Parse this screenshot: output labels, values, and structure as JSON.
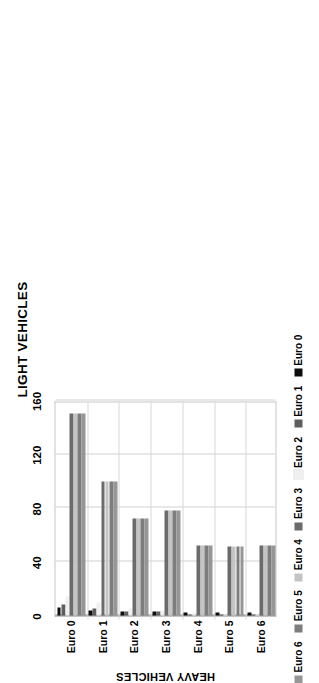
{
  "chart_data": {
    "type": "bar",
    "title": "LIGHT VEHICLES",
    "orientation": "horizontal",
    "xlabel": "",
    "ylabel": "HEAVY VEHICLES",
    "categories": [
      "Euro 0",
      "Euro 1",
      "Euro 2",
      "Euro 3",
      "Euro 4",
      "Euro 5",
      "Euro 6"
    ],
    "xlim": [
      0,
      160
    ],
    "xticks": [
      0,
      40,
      80,
      120,
      160
    ],
    "xtick_labels": [
      "0",
      "40",
      "80",
      "120",
      "160"
    ],
    "grid": true,
    "legend_position": "bottom",
    "legend_order_displayed": [
      "Euro 6",
      "Euro 5",
      "Euro 4",
      "Euro 3",
      "Euro 2",
      "Euro 1",
      "Euro 0"
    ],
    "series": [
      {
        "name": "Euro 0",
        "color": "#0d0d0d",
        "values": [
          6,
          4,
          3,
          3,
          2,
          2,
          2
        ]
      },
      {
        "name": "Euro 1",
        "color": "#5e5e5e",
        "values": [
          8,
          5,
          3,
          3,
          1,
          1,
          1
        ]
      },
      {
        "name": "Euro 2",
        "color": "#f0f0f0",
        "values": [
          14,
          10,
          5,
          4,
          2,
          1,
          1
        ]
      },
      {
        "name": "Euro 3",
        "color": "#6b6b6b",
        "values": [
          150,
          100,
          72,
          78,
          52,
          51,
          52
        ]
      },
      {
        "name": "Euro 4",
        "color": "#c4c4c4",
        "values": [
          150,
          100,
          72,
          78,
          52,
          51,
          52
        ]
      },
      {
        "name": "Euro 5",
        "color": "#7d7d7d",
        "values": [
          150,
          100,
          72,
          78,
          52,
          51,
          52
        ]
      },
      {
        "name": "Euro 6",
        "color": "#969696",
        "values": [
          150,
          100,
          72,
          78,
          52,
          51,
          52
        ]
      }
    ]
  }
}
